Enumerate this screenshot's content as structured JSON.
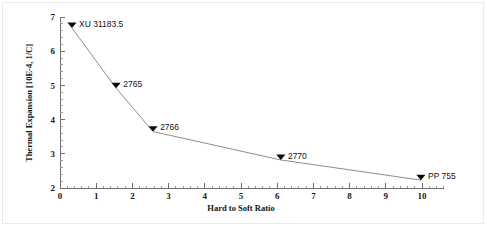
{
  "chart_data": {
    "type": "line",
    "title": "",
    "subtitle": "",
    "xlabel": "Hard to Soft Ratio",
    "ylabel": "Thermal Expansion [10E-4, 1/C]",
    "xlim": [
      0,
      10.6
    ],
    "ylim": [
      2,
      7
    ],
    "xticks": [
      0,
      1,
      2,
      3,
      4,
      5,
      6,
      7,
      8,
      9,
      10
    ],
    "xtick_labels": [
      "0",
      "1",
      "2",
      "3",
      "4",
      "5",
      "6",
      "7",
      "8",
      "9",
      "10"
    ],
    "yticks": [
      2,
      3,
      4,
      5,
      6,
      7
    ],
    "ytick_labels": [
      "2",
      "3",
      "4",
      "5",
      "6",
      "7"
    ],
    "minor_ticks_x": 5,
    "minor_ticks_y": 5,
    "grid": false,
    "legend": "none",
    "marker": "triangle-down",
    "marker_color": "#0b0b0b",
    "line_color": "#8e8e8e",
    "x": [
      0.33,
      1.55,
      2.57,
      6.1,
      9.97
    ],
    "y": [
      6.68,
      4.92,
      3.65,
      2.82,
      2.23
    ],
    "point_labels": [
      "XU 31183.5",
      "2765",
      "2766",
      "2770",
      "PP 755"
    ],
    "series": [
      {
        "name": "Thermal Expansion",
        "points": [
          {
            "label": "XU 31183.5",
            "x": 0.33,
            "y": 6.68
          },
          {
            "label": "2765",
            "x": 1.55,
            "y": 4.92
          },
          {
            "label": "2766",
            "x": 2.57,
            "y": 3.65
          },
          {
            "label": "2770",
            "x": 6.1,
            "y": 2.82
          },
          {
            "label": "PP 755",
            "x": 9.97,
            "y": 2.23
          }
        ]
      }
    ]
  }
}
